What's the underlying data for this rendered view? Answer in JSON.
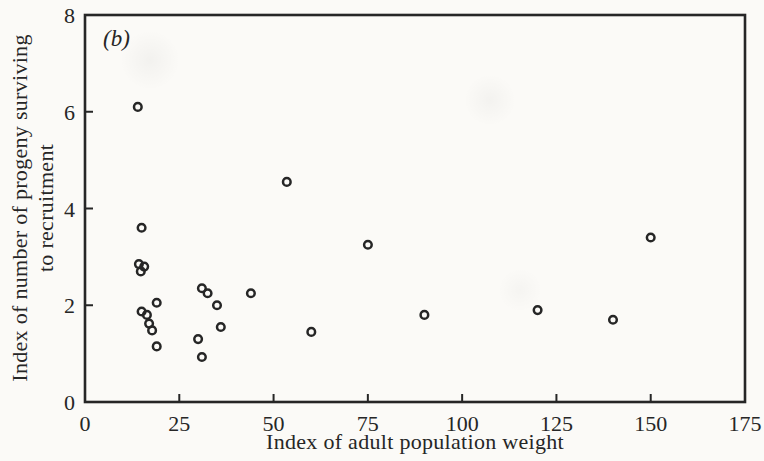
{
  "figure": {
    "panel_label": "(b)",
    "x_axis": {
      "label": "Index of adult population weight",
      "tick_labels": [
        "0",
        "25",
        "50",
        "75",
        "100",
        "125",
        "150",
        "175"
      ]
    },
    "y_axis": {
      "label_line1": "Index of number of progeny surviving",
      "label_line2": "to recruitment",
      "tick_labels": [
        "0",
        "2",
        "4",
        "6",
        "8"
      ]
    }
  },
  "chart_data": {
    "type": "scatter",
    "title": "(b)",
    "xlabel": "Index of adult population weight",
    "ylabel": "Index of number of progeny surviving to recruitment",
    "xlim": [
      0,
      175
    ],
    "ylim": [
      0,
      8
    ],
    "x_ticks": [
      0,
      25,
      50,
      75,
      100,
      125,
      150,
      175
    ],
    "y_ticks": [
      0,
      2,
      4,
      6,
      8
    ],
    "grid": false,
    "legend": "none",
    "marker": "open-circle",
    "points": [
      [
        14,
        6.1
      ],
      [
        15,
        3.6
      ],
      [
        14.3,
        2.85
      ],
      [
        15.7,
        2.8
      ],
      [
        14.8,
        2.7
      ],
      [
        19,
        2.05
      ],
      [
        15,
        1.87
      ],
      [
        16.4,
        1.8
      ],
      [
        17,
        1.62
      ],
      [
        17.8,
        1.48
      ],
      [
        19,
        1.15
      ],
      [
        31,
        2.35
      ],
      [
        32.5,
        2.25
      ],
      [
        35,
        2.0
      ],
      [
        36,
        1.55
      ],
      [
        30,
        1.3
      ],
      [
        31,
        0.93
      ],
      [
        44,
        2.25
      ],
      [
        53.5,
        4.55
      ],
      [
        60,
        1.45
      ],
      [
        75,
        3.25
      ],
      [
        90,
        1.8
      ],
      [
        120,
        1.9
      ],
      [
        140,
        1.7
      ],
      [
        150,
        3.4
      ]
    ]
  },
  "colors": {
    "ink": "#262626",
    "paper": "#fbfaf7"
  }
}
